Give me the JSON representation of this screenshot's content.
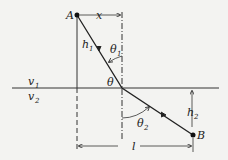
{
  "diagram": {
    "point_a": "A",
    "point_b": "B",
    "label_x": "x",
    "label_h1": "h",
    "label_h1_sub": "1",
    "label_h2": "h",
    "label_h2_sub": "2",
    "label_theta1": "θ",
    "label_theta1_sub": "1",
    "label_theta2": "θ",
    "label_theta2_sub": "2",
    "label_theta": "θ",
    "label_v1": "v",
    "label_v1_sub": "1",
    "label_v2": "v",
    "label_v2_sub": "2",
    "label_l": "l",
    "colors": {
      "line": "#222222",
      "background": "#f3f3f1"
    }
  }
}
